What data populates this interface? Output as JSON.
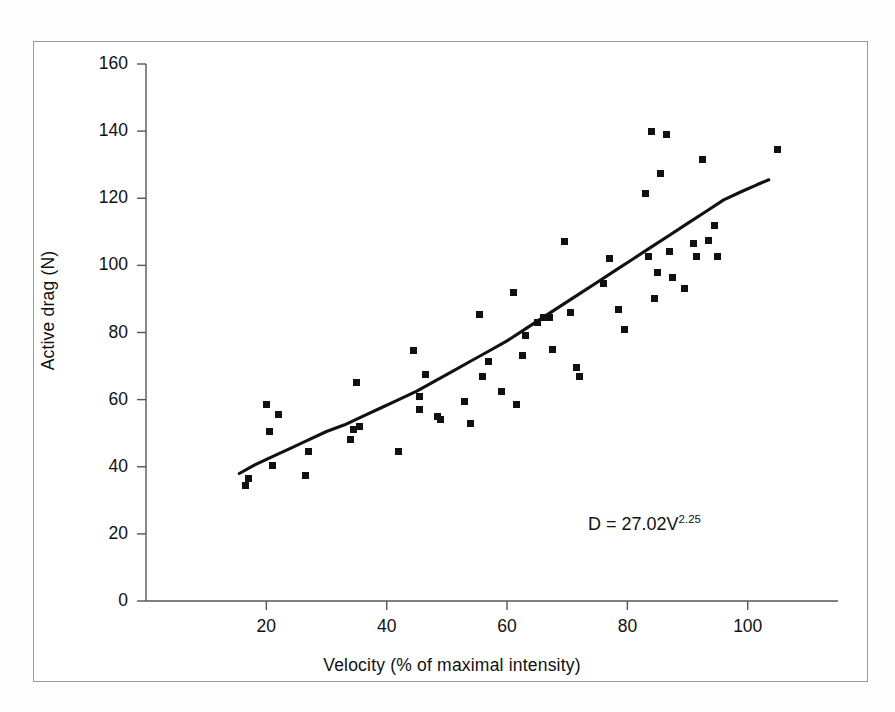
{
  "figure": {
    "background_color": "#ffffff",
    "frame_color": "#9a9a9a",
    "marker_color": "#111111",
    "line_color": "#111111"
  },
  "annotation": {
    "equation_base": "D = 27.02V",
    "equation_exponent": "2.25"
  },
  "chart_data": {
    "type": "scatter",
    "title": "",
    "xlabel": "Velocity (% of maximal intensity)",
    "ylabel": "Active drag (N)",
    "xlim": [
      0,
      115
    ],
    "ylim": [
      0,
      160
    ],
    "xticks": [
      20,
      40,
      60,
      80,
      100
    ],
    "yticks": [
      0,
      20,
      40,
      60,
      80,
      100,
      120,
      140,
      160
    ],
    "xtick_labels": [
      "20",
      "40",
      "60",
      "80",
      "100"
    ],
    "ytick_labels": [
      "0",
      "20",
      "40",
      "60",
      "80",
      "100",
      "120",
      "140",
      "160"
    ],
    "grid": false,
    "legend": null,
    "annotations": [
      {
        "text": "D = 27.02V^2.25",
        "x": 86,
        "y": 25
      }
    ],
    "series": [
      {
        "name": "Active drag measurements",
        "type": "scatter",
        "marker": "square",
        "points": [
          [
            16.5,
            34.5
          ],
          [
            17.0,
            36.5
          ],
          [
            20.0,
            58.5
          ],
          [
            20.5,
            50.5
          ],
          [
            21.0,
            40.5
          ],
          [
            22.0,
            55.5
          ],
          [
            26.5,
            37.5
          ],
          [
            27.0,
            44.5
          ],
          [
            34.0,
            48.0
          ],
          [
            34.5,
            51.0
          ],
          [
            35.0,
            65.0
          ],
          [
            35.5,
            52.0
          ],
          [
            42.0,
            44.5
          ],
          [
            44.5,
            74.5
          ],
          [
            45.5,
            57.0
          ],
          [
            45.5,
            61.0
          ],
          [
            46.5,
            67.5
          ],
          [
            48.5,
            55.0
          ],
          [
            49.0,
            54.0
          ],
          [
            53.0,
            59.5
          ],
          [
            54.0,
            53.0
          ],
          [
            55.5,
            85.5
          ],
          [
            56.0,
            67.0
          ],
          [
            57.0,
            71.5
          ],
          [
            59.0,
            62.5
          ],
          [
            61.0,
            92.0
          ],
          [
            61.5,
            58.5
          ],
          [
            62.5,
            73.0
          ],
          [
            63.0,
            79.0
          ],
          [
            65.0,
            83.0
          ],
          [
            66.0,
            84.5
          ],
          [
            67.0,
            84.5
          ],
          [
            67.5,
            75.0
          ],
          [
            69.5,
            107.0
          ],
          [
            70.5,
            86.0
          ],
          [
            71.5,
            69.5
          ],
          [
            72.0,
            67.0
          ],
          [
            76.0,
            94.5
          ],
          [
            77.0,
            102.0
          ],
          [
            78.5,
            87.0
          ],
          [
            79.5,
            81.0
          ],
          [
            83.0,
            121.5
          ],
          [
            83.5,
            102.5
          ],
          [
            84.0,
            140.0
          ],
          [
            84.5,
            90.0
          ],
          [
            85.0,
            98.0
          ],
          [
            85.5,
            127.5
          ],
          [
            86.5,
            139.0
          ],
          [
            87.0,
            104.0
          ],
          [
            87.5,
            96.5
          ],
          [
            89.5,
            93.0
          ],
          [
            91.0,
            106.5
          ],
          [
            91.5,
            102.5
          ],
          [
            92.5,
            131.5
          ],
          [
            93.5,
            107.5
          ],
          [
            94.5,
            112.0
          ],
          [
            95.0,
            102.5
          ],
          [
            105.0,
            134.5
          ]
        ]
      },
      {
        "name": "Power-law regression curve",
        "type": "line",
        "equation": "D = 27.02 * V^2.25",
        "points": [
          [
            15.5,
            38.0
          ],
          [
            18.0,
            40.5
          ],
          [
            21.0,
            43.0
          ],
          [
            24.0,
            45.5
          ],
          [
            27.0,
            48.0
          ],
          [
            30.0,
            50.5
          ],
          [
            33.0,
            52.5
          ],
          [
            36.0,
            55.0
          ],
          [
            39.0,
            57.5
          ],
          [
            42.0,
            60.0
          ],
          [
            45.0,
            62.5
          ],
          [
            48.0,
            65.5
          ],
          [
            51.0,
            68.5
          ],
          [
            54.0,
            71.5
          ],
          [
            57.0,
            74.5
          ],
          [
            60.0,
            77.5
          ],
          [
            63.0,
            81.0
          ],
          [
            66.0,
            84.5
          ],
          [
            69.0,
            88.0
          ],
          [
            72.0,
            91.5
          ],
          [
            75.0,
            95.0
          ],
          [
            78.0,
            98.5
          ],
          [
            81.0,
            102.0
          ],
          [
            84.0,
            105.5
          ],
          [
            87.0,
            109.0
          ],
          [
            90.0,
            112.5
          ],
          [
            93.0,
            116.0
          ],
          [
            96.0,
            119.5
          ],
          [
            99.0,
            122.0
          ],
          [
            101.5,
            124.0
          ],
          [
            103.5,
            125.5
          ]
        ]
      }
    ]
  }
}
